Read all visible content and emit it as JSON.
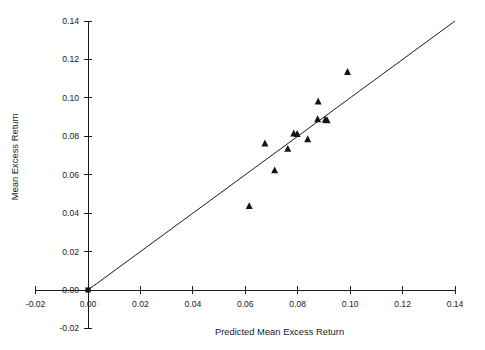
{
  "chart_data": {
    "type": "scatter",
    "title": "",
    "xlabel": "Predicted Mean Excess Return",
    "ylabel": "Mean Excess Return",
    "xlim": [
      -0.02,
      0.14
    ],
    "ylim": [
      -0.02,
      0.14
    ],
    "grid": false,
    "legend": null,
    "xticks": [
      -0.02,
      0.0,
      0.02,
      0.04,
      0.06,
      0.08,
      0.1,
      0.12,
      0.14
    ],
    "xticklabels": [
      "-0.02",
      "0.00",
      "0.02",
      "0.04",
      "0.06",
      "0.08",
      "0.10",
      "0.12",
      "0.14"
    ],
    "yticks": [
      -0.02,
      0.0,
      0.02,
      0.04,
      0.06,
      0.08,
      0.1,
      0.12,
      0.14
    ],
    "yticklabels": [
      "-0.02",
      "0.00",
      "0.02",
      "0.04",
      "0.06",
      "0.08",
      "0.10",
      "0.12",
      "0.14"
    ],
    "marker": "triangle",
    "marker_color": "#141414",
    "points": [
      {
        "x": 0.0615,
        "y": 0.0437
      },
      {
        "x": 0.0675,
        "y": 0.0763
      },
      {
        "x": 0.0712,
        "y": 0.0623
      },
      {
        "x": 0.0762,
        "y": 0.0735
      },
      {
        "x": 0.0785,
        "y": 0.0815
      },
      {
        "x": 0.0798,
        "y": 0.0812
      },
      {
        "x": 0.0838,
        "y": 0.0785
      },
      {
        "x": 0.0876,
        "y": 0.0889
      },
      {
        "x": 0.0878,
        "y": 0.0982
      },
      {
        "x": 0.0905,
        "y": 0.0887
      },
      {
        "x": 0.0912,
        "y": 0.0884
      },
      {
        "x": 0.099,
        "y": 0.1135
      }
    ],
    "reference_line": {
      "type": "identity",
      "from": {
        "x": 0.0,
        "y": 0.0
      },
      "to": {
        "x": 0.14,
        "y": 0.14
      },
      "color": "#1a1a1a"
    },
    "origin_marker": {
      "x": 0.0,
      "y": 0.0
    }
  },
  "axes": {
    "x_title": "Predicted Mean Excess Return",
    "y_title": "Mean Excess Return"
  }
}
